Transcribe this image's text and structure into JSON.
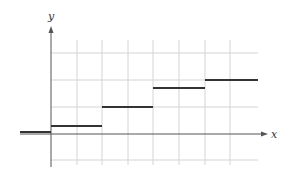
{
  "figure": {
    "width": 292,
    "height": 181,
    "colors": {
      "background": "#ffffff",
      "grid": "#d4d4d4",
      "axis": "#555555",
      "step": "#333333"
    },
    "axes": {
      "x_label": "x",
      "y_label": "y",
      "origin_px": [
        51,
        134
      ],
      "x_axis_end_px": 268,
      "y_axis_top_px": 26,
      "y_axis_bottom_px": 167
    },
    "grid": {
      "vertical_px": [
        77,
        102,
        128,
        153,
        179,
        205,
        230
      ],
      "horizontal_px": [
        53,
        80,
        107,
        160
      ],
      "x_extent_px": [
        51,
        258
      ]
    }
  },
  "chart_data": {
    "type": "line",
    "subtype": "step-function",
    "title": "",
    "xlabel": "x",
    "ylabel": "y",
    "grid": true,
    "tick_labels": "none",
    "units_note": "grid units, 1 vertical grid cell per unit; 2 vertical grid cells per step width",
    "segments": [
      {
        "x_start": -1.2,
        "x_end": 0,
        "y": 0.05
      },
      {
        "x_start": 0,
        "x_end": 2,
        "y": 0.3
      },
      {
        "x_start": 2,
        "x_end": 4,
        "y": 1.0
      },
      {
        "x_start": 4,
        "x_end": 6,
        "y": 1.7
      },
      {
        "x_start": 6,
        "x_end": 8.1,
        "y": 2.0
      }
    ],
    "segments_px": [
      {
        "x1": 20,
        "x2": 51,
        "y": 132
      },
      {
        "x1": 51,
        "x2": 102,
        "y": 126
      },
      {
        "x1": 102,
        "x2": 153,
        "y": 107
      },
      {
        "x1": 153,
        "x2": 205,
        "y": 88
      },
      {
        "x1": 205,
        "x2": 258,
        "y": 80
      }
    ]
  }
}
